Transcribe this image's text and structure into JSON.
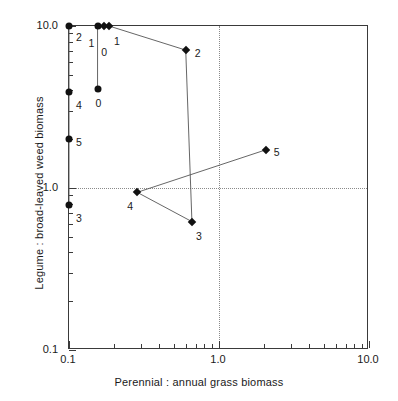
{
  "chart_data": {
    "type": "scatter",
    "title": "",
    "xlabel": "Perennial : annual grass biomass",
    "ylabel": "Legume : broad-leaved weed biomass",
    "xscale": "log",
    "yscale": "log",
    "xlim": [
      0.1,
      10.0
    ],
    "ylim": [
      0.1,
      10.0
    ],
    "grid": false,
    "reference_lines": {
      "x": 1.0,
      "y": 1.0,
      "style": "dotted"
    },
    "xticks": [
      "0.1",
      "1.0",
      "10.0"
    ],
    "yticks": [
      "0.1",
      "1.0",
      "10.0"
    ],
    "series": [
      {
        "name": "circles",
        "marker": "circle",
        "connected": true,
        "points": [
          {
            "label": "2",
            "x": 0.1,
            "y": 10.0
          },
          {
            "label": "4",
            "x": 0.1,
            "y": 3.9
          },
          {
            "label": "5",
            "x": 0.1,
            "y": 2.0
          },
          {
            "label": "3",
            "x": 0.1,
            "y": 0.79
          }
        ]
      },
      {
        "name": "circles-second-column",
        "marker": "circle",
        "connected": true,
        "points": [
          {
            "label": "1",
            "x": 0.155,
            "y": 10.0
          },
          {
            "label": "0",
            "x": 0.155,
            "y": 4.1
          }
        ]
      },
      {
        "name": "diamonds",
        "marker": "diamond",
        "connected": true,
        "points": [
          {
            "label": "1",
            "x": 0.185,
            "y": 10.0
          },
          {
            "label": "2",
            "x": 0.6,
            "y": 7.1
          },
          {
            "label": "3",
            "x": 0.66,
            "y": 0.62
          },
          {
            "label": "4",
            "x": 0.285,
            "y": 0.94
          },
          {
            "label": "5",
            "x": 2.05,
            "y": 1.72
          }
        ]
      },
      {
        "name": "diamond-extra-top",
        "marker": "diamond",
        "connected": false,
        "points": [
          {
            "label": "0",
            "x": 0.172,
            "y": 10.0
          }
        ]
      }
    ],
    "colors": {
      "marker": "#111111",
      "line": "#555555",
      "axis": "#3a3a3a",
      "refline": "#8a8a8a"
    }
  }
}
